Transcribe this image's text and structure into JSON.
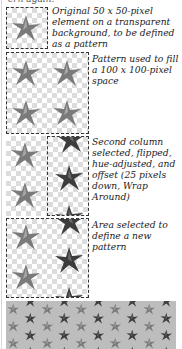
{
  "header": {
    "cut_text": "ern again."
  },
  "steps": [
    {
      "caption": "Original 50 x 50-pixel element on a transparent background, to be defined as a pattern"
    },
    {
      "caption": "Pattern used to fill a 100 x 100-pixel space"
    },
    {
      "caption": "Second column selected, flipped, hue-adjusted, and offset (25 pixels down, Wrap Around)"
    },
    {
      "caption": "Area selected to define a new pattern"
    }
  ],
  "colors": {
    "star_light": "#7a7a7a",
    "star_dark": "#3c3c3c",
    "tile_bg": "#bdbdbd",
    "border": "#333333"
  }
}
